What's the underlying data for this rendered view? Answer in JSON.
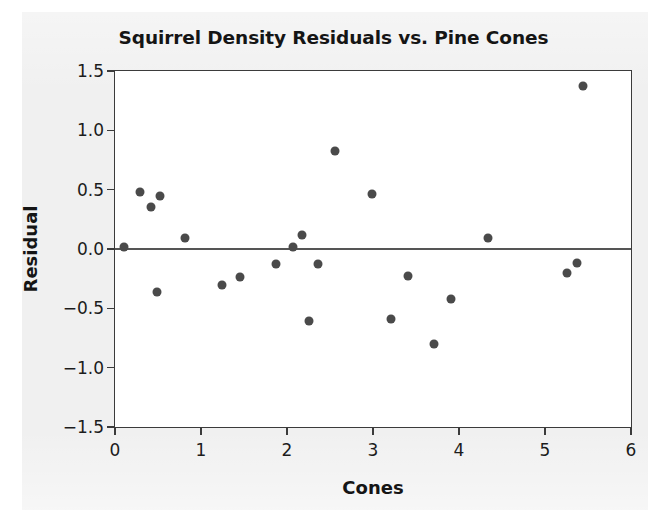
{
  "chart_data": {
    "type": "scatter",
    "title": "Squirrel Density Residuals vs. Pine Cones",
    "xlabel": "Cones",
    "ylabel": "Residual",
    "xlim": [
      0,
      6
    ],
    "ylim": [
      -1.5,
      1.5
    ],
    "xticks": [
      0,
      1,
      2,
      3,
      4,
      5,
      6
    ],
    "xtick_labels": [
      "0",
      "1",
      "2",
      "3",
      "4",
      "5",
      "6"
    ],
    "yticks": [
      -1.5,
      -1.0,
      -0.5,
      0.0,
      0.5,
      1.0,
      1.5
    ],
    "ytick_labels": [
      "−1.5",
      "−1.0",
      "−0.5",
      "0.0",
      "0.5",
      "1.0",
      "1.5"
    ],
    "grid": false,
    "legend": null,
    "reference_lines": [
      {
        "axis": "y",
        "value": 0.0,
        "color": "#555555"
      }
    ],
    "marker_color": "#4a4a4a",
    "points": [
      {
        "x": 0.1,
        "y": 0.02
      },
      {
        "x": 0.29,
        "y": 0.48
      },
      {
        "x": 0.42,
        "y": 0.35
      },
      {
        "x": 0.52,
        "y": 0.45
      },
      {
        "x": 0.49,
        "y": -0.36
      },
      {
        "x": 0.81,
        "y": 0.09
      },
      {
        "x": 1.24,
        "y": -0.3
      },
      {
        "x": 1.45,
        "y": -0.24
      },
      {
        "x": 1.87,
        "y": -0.13
      },
      {
        "x": 2.07,
        "y": 0.02
      },
      {
        "x": 2.17,
        "y": 0.12
      },
      {
        "x": 2.36,
        "y": -0.13
      },
      {
        "x": 2.26,
        "y": -0.61
      },
      {
        "x": 2.56,
        "y": 0.83
      },
      {
        "x": 2.99,
        "y": 0.46
      },
      {
        "x": 3.21,
        "y": -0.59
      },
      {
        "x": 3.41,
        "y": -0.23
      },
      {
        "x": 3.71,
        "y": -0.8
      },
      {
        "x": 3.91,
        "y": -0.42
      },
      {
        "x": 4.34,
        "y": 0.09
      },
      {
        "x": 5.25,
        "y": -0.2
      },
      {
        "x": 5.37,
        "y": -0.12
      },
      {
        "x": 5.44,
        "y": 1.37
      }
    ]
  }
}
